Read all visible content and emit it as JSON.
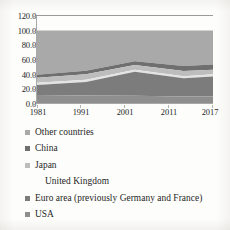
{
  "chart_data": {
    "type": "area",
    "stacked": true,
    "title": "",
    "subtitle": "",
    "xlabel": "",
    "ylabel": "",
    "x": [
      1981,
      1991,
      2001,
      2011,
      2017
    ],
    "tick_labels_x": [
      "1981",
      "1991",
      "2001",
      "2011",
      "2017"
    ],
    "tick_labels_y": [
      "0.0",
      "20.0",
      "40.0",
      "60.0",
      "80.0",
      "100.0",
      "120.0"
    ],
    "ylim": [
      0,
      120
    ],
    "ytick_step": 20,
    "xlim": [
      1981,
      2017
    ],
    "grid": false,
    "legend_position": "below",
    "series": [
      {
        "name": "USA",
        "color": "#8e8e8e",
        "values": [
          11.0,
          10.5,
          10.0,
          9.0,
          9.0
        ]
      },
      {
        "name": "Euro area (previously Germany and France)",
        "color": "#7c7c7c",
        "values": [
          14.0,
          18.5,
          33.0,
          25.0,
          27.5
        ]
      },
      {
        "name": "United Kingdom",
        "color": "#e3e3e3",
        "values": [
          3.0,
          3.0,
          3.0,
          3.0,
          3.0
        ]
      },
      {
        "name": "Japan",
        "color": "#bdbdbd",
        "values": [
          7.0,
          7.5,
          6.5,
          7.0,
          6.5
        ]
      },
      {
        "name": "China",
        "color": "#6f6f6f",
        "values": [
          4.0,
          5.0,
          5.0,
          7.0,
          7.0
        ]
      },
      {
        "name": "Other countries",
        "color": "#a9a9a9",
        "values": [
          61.0,
          55.5,
          42.5,
          49.0,
          47.0
        ]
      }
    ],
    "cumulative_tops": {
      "usa": [
        11.0,
        10.5,
        10.0,
        9.0,
        9.0
      ],
      "euro": [
        25.0,
        29.0,
        43.0,
        34.0,
        36.5
      ],
      "uk": [
        28.0,
        32.0,
        46.0,
        37.0,
        39.5
      ],
      "japan": [
        35.0,
        39.5,
        52.5,
        44.0,
        46.0
      ],
      "china": [
        39.0,
        44.5,
        57.5,
        51.0,
        53.0
      ],
      "other": [
        100.0,
        100.0,
        100.0,
        100.0,
        100.0
      ]
    }
  },
  "axis": {
    "y_labels": [
      "120.0",
      "100.0",
      "80.0",
      "60.0",
      "40.0",
      "20.0",
      "0.0"
    ],
    "x_labels": [
      "1981",
      "1991",
      "2001",
      "2011",
      "2017"
    ]
  },
  "legend": {
    "items": [
      {
        "label": "Other countries",
        "color": "#a9a9a9",
        "has_marker": true
      },
      {
        "label": "China",
        "color": "#6f6f6f",
        "has_marker": true
      },
      {
        "label": "Japan",
        "color": "#bdbdbd",
        "has_marker": true
      },
      {
        "label": "United Kingdom",
        "color": "#efefef",
        "has_marker": false
      },
      {
        "label": "Euro area (previously Germany and France)",
        "color": "#7c7c7c",
        "has_marker": true
      },
      {
        "label": "USA",
        "color": "#8e8e8e",
        "has_marker": true
      }
    ]
  }
}
